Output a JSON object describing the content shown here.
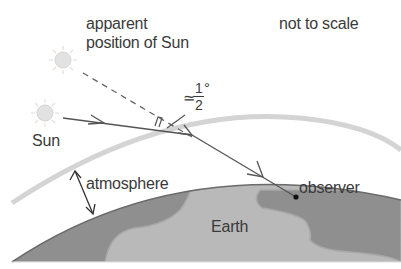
{
  "diagram": {
    "labels": {
      "apparent_line1": "apparent",
      "apparent_line2": "position of Sun",
      "not_to_scale": "not to scale",
      "sun": "Sun",
      "angle_approx": "≃",
      "angle_num": "1",
      "angle_den": "2",
      "angle_unit": "°",
      "atmosphere": "atmosphere",
      "observer": "observer",
      "earth": "Earth"
    },
    "colors": {
      "background": "#ffffff",
      "earth": "#b9b9b9",
      "land": "#8f8f8f",
      "earth_outline": "#6a6a6a",
      "atmosphere_band": "#d4d4d4",
      "ray": "#555555",
      "sun_fill": "#e2e2e2",
      "sun_rays": "#f0dcd2",
      "text": "#3a3a3a"
    },
    "elements": {
      "true_sun": {
        "cx": 45,
        "cy": 113,
        "r": 8
      },
      "apparent_sun": {
        "cx": 63,
        "cy": 60,
        "r": 8
      },
      "observer_point": {
        "cx": 296,
        "cy": 197
      }
    }
  }
}
